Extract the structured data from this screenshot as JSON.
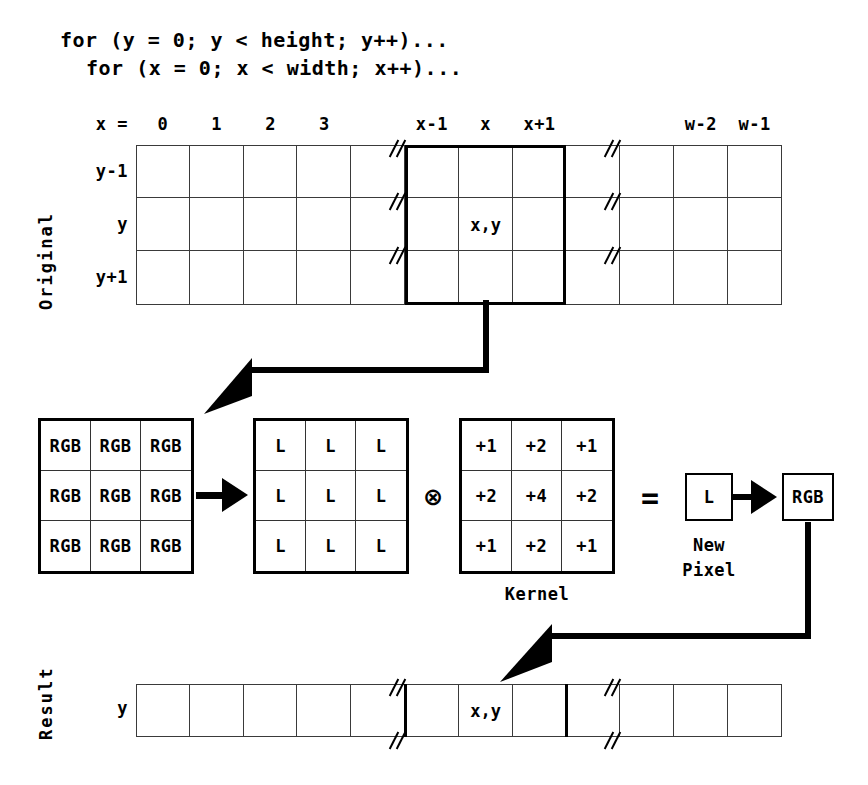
{
  "code": {
    "lines": [
      "for (y = 0; y < height; y++)...",
      "for (x = 0; x < width; x++)..."
    ]
  },
  "original": {
    "section_label": "Original",
    "axis_label": "x =",
    "column_headers": [
      "0",
      "1",
      "2",
      "3",
      "",
      "x-1",
      "x",
      "x+1",
      "",
      "",
      "w-2",
      "w-1"
    ],
    "row_headers": [
      "y-1",
      "y",
      "y+1"
    ],
    "center_cell": "x,y",
    "break_columns": [
      4,
      8
    ],
    "highlight_columns": [
      5,
      6,
      7
    ],
    "columns": 12,
    "rows": 3
  },
  "pipeline": {
    "rgb_matrix": {
      "label": "rgb-neighborhood",
      "values": [
        [
          "RGB",
          "RGB",
          "RGB"
        ],
        [
          "RGB",
          "RGB",
          "RGB"
        ],
        [
          "RGB",
          "RGB",
          "RGB"
        ]
      ]
    },
    "luminance_matrix": {
      "label": "luminance-neighborhood",
      "values": [
        [
          "L",
          "L",
          "L"
        ],
        [
          "L",
          "L",
          "L"
        ],
        [
          "L",
          "L",
          "L"
        ]
      ]
    },
    "kernel_matrix": {
      "label": "Kernel",
      "values": [
        [
          "+1",
          "+2",
          "+1"
        ],
        [
          "+2",
          "+4",
          "+2"
        ],
        [
          "+1",
          "+2",
          "+1"
        ]
      ]
    },
    "convolve_operator": "⊗",
    "equals_operator": "=",
    "new_pixel": {
      "luminance": "L",
      "rgb": "RGB",
      "caption_line1": "New",
      "caption_line2": "Pixel"
    }
  },
  "result": {
    "section_label": "Result",
    "row_header": "y",
    "center_cell": "x,y",
    "columns": 12,
    "break_columns": [
      4,
      8
    ],
    "highlight_columns": [
      5,
      6,
      7
    ]
  },
  "colors": {
    "ink": "#000000",
    "grid_line": "#3a3a3a",
    "background": "#ffffff"
  }
}
